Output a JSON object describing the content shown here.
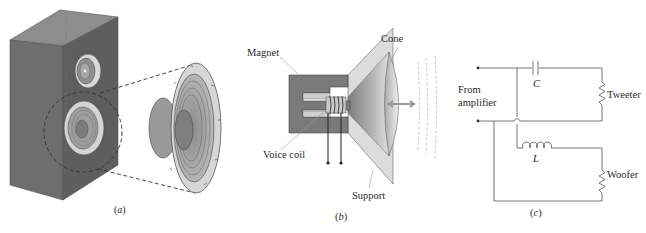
{
  "figure": {
    "panels": [
      {
        "id": "a",
        "caption_letter": "a",
        "description": "Loudspeaker cabinet with tweeter and woofer; woofer shown exploded"
      },
      {
        "id": "b",
        "caption_letter": "b",
        "labels": {
          "magnet": "Magnet",
          "cone": "Cone",
          "voice_coil": "Voice coil",
          "support": "Support"
        }
      },
      {
        "id": "c",
        "caption_letter": "c",
        "labels": {
          "source": "From",
          "source_line2": "amplifier",
          "capacitor": "C",
          "inductor": "L",
          "tweeter": "Tweeter",
          "woofer": "Woofer"
        }
      }
    ],
    "colors": {
      "cabinet_front": "#6e6e6e",
      "cabinet_side": "#5a5a5a",
      "cabinet_top": "#8a8a8a",
      "speaker_rim": "#dcdcdc",
      "magnet": "#7a7a7a",
      "wire": "#555555",
      "text": "#2a2a2a"
    }
  }
}
